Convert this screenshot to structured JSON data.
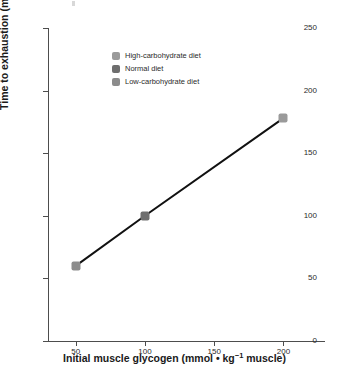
{
  "chart_data": {
    "type": "line",
    "title": "",
    "subtitle": "",
    "xlabel_parts": {
      "before": "Initial muscle glycogen (mmol • kg",
      "superscript": "−1",
      "after": " muscle)"
    },
    "xlabel": "Initial muscle glycogen (mmol • kg−1 muscle)",
    "ylabel": "Time to exhaustion (min)",
    "x": [
      50,
      100,
      200
    ],
    "values": [
      60,
      100,
      178
    ],
    "point_labels": [
      "Low-carbohydrate diet",
      "Normal diet",
      "High-carbohydrate diet"
    ],
    "point_colors": [
      "#8c8c8c",
      "#6e6e6e",
      "#9a9a9a"
    ],
    "xlim": [
      30,
      230
    ],
    "ylim": [
      0,
      250
    ],
    "xticks": [
      50,
      100,
      150,
      200
    ],
    "xtick_labels": [
      "50",
      "100",
      "150",
      "200"
    ],
    "yticks": [
      0,
      50,
      100,
      150,
      200,
      250
    ],
    "ytick_labels": [
      "0",
      "50",
      "100",
      "150",
      "200",
      "250"
    ],
    "grid": false,
    "line_color": "#111111",
    "line_width": 2,
    "axis_color": "#4d4d4d",
    "legend_position": "top-left",
    "legend": [
      {
        "label": "High-carbohydrate diet",
        "color": "#9a9a9a"
      },
      {
        "label": "Normal diet",
        "color": "#6e6e6e"
      },
      {
        "label": "Low-carbohydrate diet",
        "color": "#8c8c8c"
      }
    ]
  }
}
